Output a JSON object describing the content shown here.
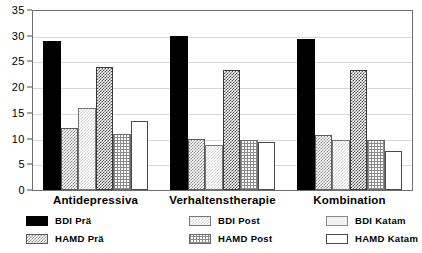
{
  "chart_data": {
    "type": "bar",
    "title": "",
    "subtitle": "",
    "xlabel": "",
    "ylabel": "",
    "ylim": [
      0,
      35
    ],
    "ytick_labels": [
      "0",
      "5",
      "10",
      "15",
      "20",
      "25",
      "30",
      "35"
    ],
    "ytick_values": [
      0,
      5,
      10,
      15,
      20,
      25,
      30,
      35
    ],
    "grid": true,
    "legend_position": "below",
    "categories": [
      "Antidepressiva",
      "Verhaltenstherapie",
      "Kombination"
    ],
    "series": [
      {
        "name": "BDI Prä",
        "fill": "solid-black",
        "values": [
          29.0,
          29.9,
          29.3
        ]
      },
      {
        "name": "HAMD Prä",
        "fill": "checker-medium",
        "values": [
          12.0,
          9.9,
          10.7
        ]
      },
      {
        "name": "BDI Post",
        "fill": "checker-light",
        "values": [
          15.9,
          8.8,
          9.7
        ]
      },
      {
        "name": "HAMD Post",
        "fill": "checker-dark",
        "values": [
          24.0,
          23.3,
          23.3
        ]
      },
      {
        "name": "BDI Katam",
        "fill": "grid-fine",
        "values": [
          10.9,
          9.8,
          9.7
        ]
      },
      {
        "name": "HAMD Katam",
        "fill": "white-outline",
        "values": [
          13.4,
          9.3,
          7.5
        ]
      }
    ]
  },
  "legend": {
    "columns": [
      {
        "heading": "Antidepressiva",
        "entries": [
          {
            "label": "BDI Prä",
            "fill": "solid-black"
          },
          {
            "label": "HAMD Prä",
            "fill": "checker-medium"
          }
        ]
      },
      {
        "heading": "Verhaltenstherapie",
        "entries": [
          {
            "label": "BDI Post",
            "fill": "checker-light"
          },
          {
            "label": "HAMD Post",
            "fill": "grid-fine"
          }
        ]
      },
      {
        "heading": "Kombination",
        "entries": [
          {
            "label": "BDI Katam",
            "fill": "pale"
          },
          {
            "label": "HAMD Katam",
            "fill": "white-outline"
          }
        ]
      }
    ]
  },
  "colors": {
    "frame": "#6f6f6f",
    "gridline": "#d8d8d8",
    "bar_dark": "#000000",
    "background": "#ffffff"
  }
}
